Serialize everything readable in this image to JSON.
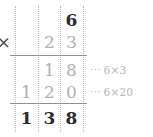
{
  "problem": {
    "multiplicand": "6",
    "multiplier": "23",
    "operator": "×",
    "product": "138"
  },
  "rows": {
    "top": {
      "units": "6"
    },
    "multiplier_row": {
      "operator": "×",
      "tens": "2",
      "units": "3"
    },
    "partial_1": {
      "tens": "1",
      "units": "8",
      "annotation_dots": "⋯",
      "annotation_text": "6×3"
    },
    "partial_2": {
      "hundreds": "1",
      "tens": "2",
      "units": "0",
      "annotation_dots": "⋯",
      "annotation_text": "6×20"
    },
    "answer": {
      "hundreds": "1",
      "tens": "3",
      "units": "8"
    }
  },
  "colors": {
    "ink_dark": "#2b2b2b",
    "ink_light": "#b0b0b0",
    "operator": "#4a4a4a",
    "rule": "#8f8f8f",
    "column_dotted": "#b9b9b9",
    "annotation": "#b5b5b5",
    "background": "#ffffff"
  }
}
